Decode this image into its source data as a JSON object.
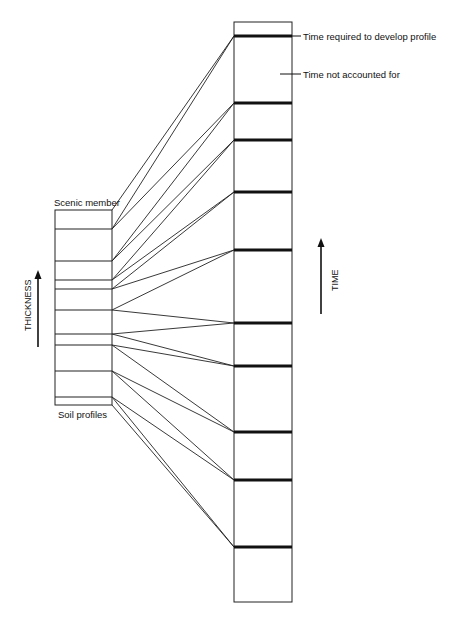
{
  "diagram": {
    "type": "correlation-diagram",
    "labels": {
      "left_top": "Scenic member",
      "left_bottom": "Soil profiles",
      "left_axis": "THICKNESS",
      "right_axis": "TIME",
      "legend_thick": "Time required to develop profile",
      "legend_gap": "Time not accounted for"
    },
    "left_column": {
      "x": 55,
      "width": 57,
      "boundaries_y": [
        210,
        229,
        261,
        280,
        289,
        310,
        334,
        345,
        371,
        397,
        405
      ]
    },
    "right_column": {
      "x": 234,
      "width": 58,
      "top": 22,
      "bottom": 602,
      "thick_lines_y": [
        36,
        103,
        140,
        192,
        250,
        323,
        366,
        432,
        480,
        547
      ]
    },
    "colors": {
      "line": "#222222",
      "thick": "#111111",
      "background": "#ffffff"
    }
  }
}
